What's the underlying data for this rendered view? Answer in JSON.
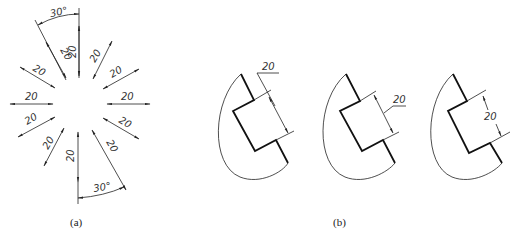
{
  "figure_a": {
    "caption": "(a)",
    "dimension_value": "20",
    "angle_top": "30°",
    "angle_bottom": "30°",
    "arrow_labels": [
      "20",
      "20",
      "20",
      "20",
      "20",
      "20",
      "20",
      "20",
      "20",
      "20",
      "20",
      "20"
    ]
  },
  "figure_b": {
    "caption": "(b)",
    "views": [
      {
        "name": "leader-above",
        "dimension": "20"
      },
      {
        "name": "leader-side",
        "dimension": "20"
      },
      {
        "name": "inline",
        "dimension": "20"
      }
    ]
  },
  "colors": {
    "line": "#222222",
    "background": "#ffffff"
  }
}
